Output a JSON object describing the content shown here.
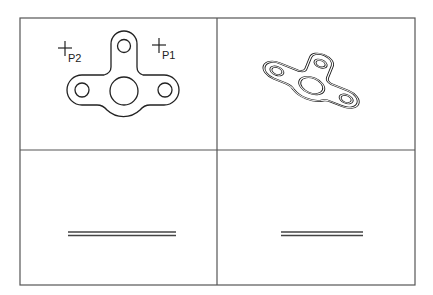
{
  "figure": {
    "layout": "2x2 grid of views",
    "frame": {
      "x": 20,
      "y": 18,
      "width": 395,
      "height": 267
    },
    "divider_x": 217,
    "divider_y": 150
  },
  "panels": [
    {
      "position": "top-left",
      "view": "plan view of gasket",
      "points": [
        {
          "label": "P2",
          "marker": "crosshair-icon",
          "x": 65,
          "y": 48
        },
        {
          "label": "P1",
          "marker": "crosshair-icon",
          "x": 159,
          "y": 45
        }
      ]
    },
    {
      "position": "top-right",
      "view": "3D isometric view of gasket"
    },
    {
      "position": "bottom-left",
      "view": "edge view (double line)"
    },
    {
      "position": "bottom-right",
      "view": "edge view (double line)"
    }
  ],
  "labels": {
    "p1": "P1",
    "p2": "P2"
  },
  "colors": {
    "line": "#222222",
    "frame": "#555555",
    "background": "#ffffff"
  }
}
